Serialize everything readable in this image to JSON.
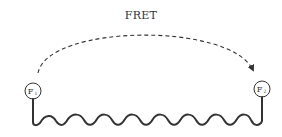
{
  "diagram": {
    "title": "FRET",
    "nodes": [
      {
        "id": "F1",
        "label": "F",
        "subscript": "1",
        "cx": 33,
        "cy": 91,
        "r": 8
      },
      {
        "id": "F2",
        "label": "F",
        "subscript": "2",
        "cx": 262,
        "cy": 89,
        "r": 8
      }
    ],
    "arrow": {
      "from": "F1",
      "to": "F2",
      "style": "dashed",
      "meaning": "energy transfer"
    },
    "linker": {
      "type": "wavy-chain",
      "humps": 8
    },
    "colors": {
      "stroke": "#333333",
      "background": "#ffffff"
    }
  }
}
